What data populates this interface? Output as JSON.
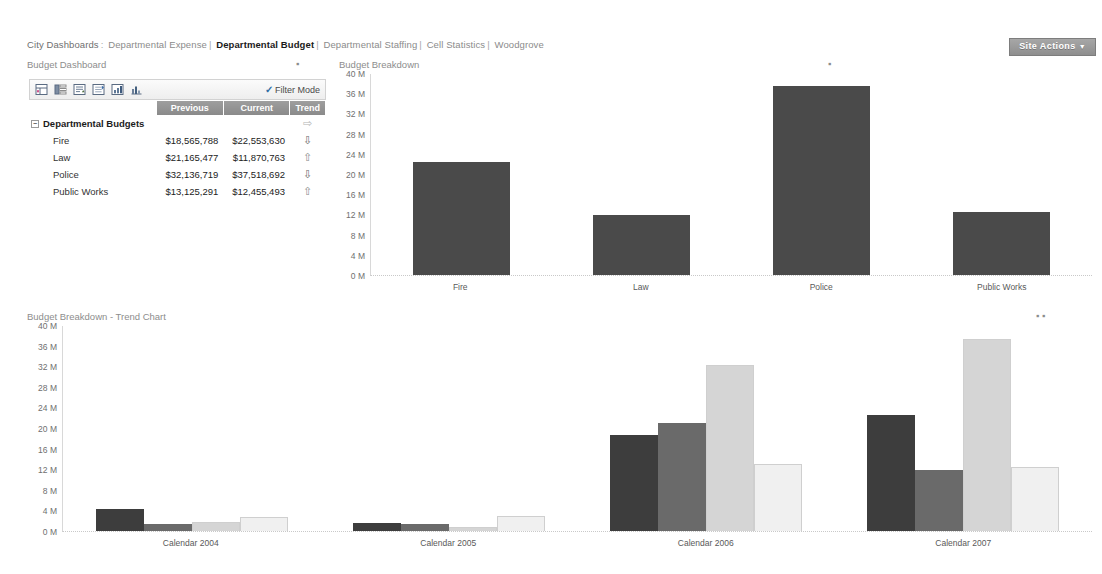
{
  "breadcrumb": {
    "root": "City Dashboards",
    "root_sep": ":",
    "items": [
      {
        "label": "Departmental Expense",
        "active": false
      },
      {
        "label": "Departmental Budget",
        "active": true
      },
      {
        "label": "Departmental Staffing",
        "active": false
      },
      {
        "label": "Cell Statistics",
        "active": false
      },
      {
        "label": "Woodgrove",
        "active": false
      }
    ],
    "separator": "|"
  },
  "site_actions": {
    "label": "Site Actions",
    "caret": "▼"
  },
  "panels": {
    "dashboard": {
      "title": "Budget Dashboard",
      "menu": "▪"
    },
    "breakdown": {
      "title": "Budget Breakdown",
      "menu": "▪"
    },
    "trend": {
      "title": "Budget Breakdown - Trend Chart",
      "menu": "▪  ▪"
    }
  },
  "toolbar": {
    "icons": [
      "scorecard-icon",
      "filter-column-icon",
      "sort-icon",
      "expand-icon",
      "chart-bar-icon",
      "chart-detail-icon"
    ],
    "filter_mode_label": "Filter Mode",
    "filter_check": "✓"
  },
  "scorecard": {
    "columns": [
      "",
      "Previous",
      "Current",
      "Trend"
    ],
    "group": {
      "label": "Departmental Budgets",
      "expander": "−",
      "previous": "",
      "current": "",
      "trend": "⇨",
      "trend_dir": "flat"
    },
    "rows": [
      {
        "label": "Fire",
        "previous": "$18,565,788",
        "current": "$22,553,630",
        "trend": "⇩",
        "trend_dir": "down"
      },
      {
        "label": "Law",
        "previous": "$21,165,477",
        "current": "$11,870,763",
        "trend": "⇧",
        "trend_dir": "up"
      },
      {
        "label": "Police",
        "previous": "$32,136,719",
        "current": "$37,518,692",
        "trend": "⇩",
        "trend_dir": "down"
      },
      {
        "label": "Public Works",
        "previous": "$13,125,291",
        "current": "$12,455,493",
        "trend": "⇧",
        "trend_dir": "up"
      }
    ]
  },
  "chart_data": [
    {
      "id": "breakdown",
      "type": "bar",
      "title": "Budget Breakdown",
      "xlabel": "",
      "ylabel": "",
      "ylim": [
        0,
        40
      ],
      "unit": "M",
      "yticks": [
        40,
        36,
        32,
        28,
        24,
        20,
        16,
        12,
        8,
        4,
        0
      ],
      "ytick_labels": [
        "40 M",
        "36 M",
        "32 M",
        "28 M",
        "24 M",
        "20 M",
        "16 M",
        "12 M",
        "8 M",
        "4 M",
        "0 M"
      ],
      "grid": false,
      "legend": "none",
      "categories": [
        "Fire",
        "Law",
        "Police",
        "Public Works"
      ],
      "values": [
        22.55,
        11.87,
        37.52,
        12.46
      ],
      "color": "#4a4a4a"
    },
    {
      "id": "trend",
      "type": "bar",
      "title": "Budget Breakdown - Trend Chart",
      "xlabel": "",
      "ylabel": "",
      "ylim": [
        0,
        40
      ],
      "unit": "M",
      "yticks": [
        40,
        36,
        32,
        28,
        24,
        20,
        16,
        12,
        8,
        4,
        0
      ],
      "ytick_labels": [
        "40 M",
        "36 M",
        "32 M",
        "28 M",
        "24 M",
        "20 M",
        "16 M",
        "12 M",
        "8 M",
        "4 M",
        "0 M"
      ],
      "grid": false,
      "legend": "none",
      "categories": [
        "Calendar 2004",
        "Calendar 2005",
        "Calendar 2006",
        "Calendar 2007"
      ],
      "series": [
        {
          "name": "Fire",
          "color": "#3d3d3d",
          "values": [
            4.3,
            1.5,
            18.7,
            22.55
          ]
        },
        {
          "name": "Law",
          "color": "#6a6a6a",
          "values": [
            1.3,
            1.4,
            21.0,
            11.87
          ]
        },
        {
          "name": "Police",
          "color": "#d5d5d5",
          "values": [
            1.7,
            0.7,
            32.3,
            37.52
          ]
        },
        {
          "name": "Public Works",
          "color": "#f0f0f0",
          "values": [
            2.7,
            3.0,
            13.0,
            12.46
          ]
        }
      ]
    }
  ]
}
